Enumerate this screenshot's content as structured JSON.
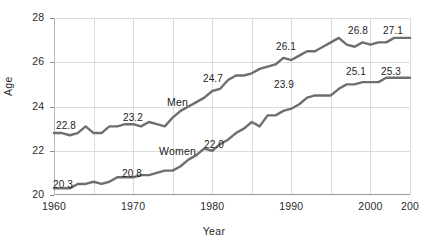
{
  "chart_data": {
    "type": "line",
    "title": "",
    "xlabel": "Year",
    "ylabel": "Age",
    "xlim": [
      1960,
      2005
    ],
    "ylim": [
      20,
      28
    ],
    "grid": true,
    "legend_position": "inline-labels",
    "xticks": [
      "1960",
      "1970",
      "1980",
      "1990",
      "2000",
      "200"
    ],
    "xtick_values": [
      1960,
      1970,
      1980,
      1990,
      2000,
      2005
    ],
    "yticks": [
      "20",
      "22",
      "24",
      "26",
      "28"
    ],
    "ytick_values": [
      20,
      22,
      24,
      26,
      28
    ],
    "x": [
      1960,
      1961,
      1962,
      1963,
      1964,
      1965,
      1966,
      1967,
      1968,
      1969,
      1970,
      1971,
      1972,
      1973,
      1974,
      1975,
      1976,
      1977,
      1978,
      1979,
      1980,
      1981,
      1982,
      1983,
      1984,
      1985,
      1986,
      1987,
      1988,
      1989,
      1990,
      1991,
      1992,
      1993,
      1994,
      1995,
      1996,
      1997,
      1998,
      1999,
      2000,
      2001,
      2002,
      2003,
      2004,
      2005
    ],
    "series": [
      {
        "name": "Men",
        "color": "#6e6e6e",
        "values": [
          22.8,
          22.8,
          22.7,
          22.8,
          23.1,
          22.8,
          22.8,
          23.1,
          23.1,
          23.2,
          23.2,
          23.1,
          23.3,
          23.2,
          23.1,
          23.5,
          23.8,
          24.0,
          24.2,
          24.4,
          24.7,
          24.8,
          25.2,
          25.4,
          25.4,
          25.5,
          25.7,
          25.8,
          25.9,
          26.2,
          26.1,
          26.3,
          26.5,
          26.5,
          26.7,
          26.9,
          27.1,
          26.8,
          26.7,
          26.9,
          26.8,
          26.9,
          26.9,
          27.1,
          27.1,
          27.1
        ],
        "point_labels": [
          {
            "x": 1960,
            "y": 22.8,
            "text": "22.8"
          },
          {
            "x": 1970,
            "y": 23.2,
            "text": "23.2"
          },
          {
            "x": 1980,
            "y": 24.7,
            "text": "24.7"
          },
          {
            "x": 1990,
            "y": 26.1,
            "text": "26.1"
          },
          {
            "x": 2000,
            "y": 26.8,
            "text": "26.8"
          },
          {
            "x": 2005,
            "y": 27.1,
            "text": "27.1"
          }
        ]
      },
      {
        "name": "Women",
        "color": "#6e6e6e",
        "values": [
          20.3,
          20.3,
          20.3,
          20.5,
          20.5,
          20.6,
          20.5,
          20.6,
          20.8,
          20.8,
          20.8,
          20.9,
          20.9,
          21.0,
          21.1,
          21.1,
          21.3,
          21.6,
          21.8,
          22.1,
          22.0,
          22.3,
          22.5,
          22.8,
          23.0,
          23.3,
          23.1,
          23.6,
          23.6,
          23.8,
          23.9,
          24.1,
          24.4,
          24.5,
          24.5,
          24.5,
          24.8,
          25.0,
          25.0,
          25.1,
          25.1,
          25.1,
          25.3,
          25.3,
          25.3,
          25.3
        ],
        "point_labels": [
          {
            "x": 1960,
            "y": 20.3,
            "text": "20.3"
          },
          {
            "x": 1970,
            "y": 20.8,
            "text": "20.8"
          },
          {
            "x": 1980,
            "y": 22.0,
            "text": "22.0"
          },
          {
            "x": 1990,
            "y": 23.9,
            "text": "23.9"
          },
          {
            "x": 2000,
            "y": 25.1,
            "text": "25.1"
          },
          {
            "x": 2005,
            "y": 25.3,
            "text": "25.3"
          }
        ]
      }
    ],
    "annotations": [
      {
        "name": "men-series-label",
        "text": "Men",
        "x_px": 167,
        "y_px": 96
      },
      {
        "name": "women-series-label",
        "text": "Women",
        "x_px": 159,
        "y_px": 145
      }
    ],
    "value_label_positions": [
      {
        "name": "men-1960",
        "text": "22.8",
        "x_px": 56,
        "y_px": 120
      },
      {
        "name": "men-1970",
        "text": "23.2",
        "x_px": 123,
        "y_px": 112
      },
      {
        "name": "men-1980",
        "text": "24.7",
        "x_px": 203,
        "y_px": 73
      },
      {
        "name": "men-1990",
        "text": "26.1",
        "x_px": 276,
        "y_px": 41
      },
      {
        "name": "men-2000",
        "text": "26.8",
        "x_px": 348,
        "y_px": 25
      },
      {
        "name": "men-2005",
        "text": "27.1",
        "x_px": 383,
        "y_px": 25
      },
      {
        "name": "women-1960",
        "text": "20.3",
        "x_px": 53,
        "y_px": 179
      },
      {
        "name": "women-1970",
        "text": "20.8",
        "x_px": 122,
        "y_px": 168
      },
      {
        "name": "women-1980",
        "text": "22.0",
        "x_px": 204,
        "y_px": 139
      },
      {
        "name": "women-1990",
        "text": "23.9",
        "x_px": 274,
        "y_px": 79
      },
      {
        "name": "women-2000",
        "text": "25.1",
        "x_px": 346,
        "y_px": 66
      },
      {
        "name": "women-2005",
        "text": "25.3",
        "x_px": 381,
        "y_px": 66
      }
    ],
    "style": {
      "line_color": "#6e6e6e",
      "line_width": 2.4,
      "grid_color": "#dcdcdc",
      "axis_color": "#9a9a9a",
      "background": "#ffffff",
      "text_color": "#232323"
    }
  }
}
